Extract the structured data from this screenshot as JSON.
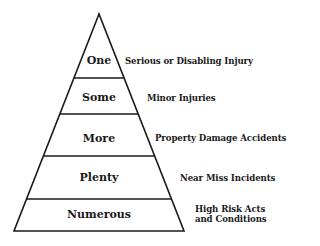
{
  "diagram": {
    "type": "pyramid",
    "levels": [
      {
        "label": "One",
        "description": "Serious or Disabling Injury"
      },
      {
        "label": "Some",
        "description": "Minor Injuries"
      },
      {
        "label": "More",
        "description": "Property Damage Accidents"
      },
      {
        "label": "Plenty",
        "description": "Near Miss Incidents"
      },
      {
        "label": "Numerous",
        "description_line1": "High Risk Acts",
        "description_line2": "and Conditions"
      }
    ]
  }
}
